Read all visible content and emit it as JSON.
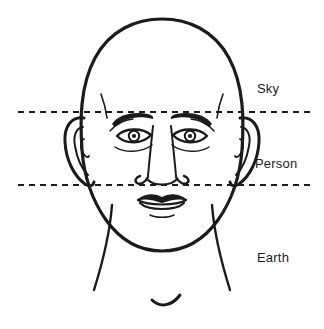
{
  "figure": {
    "background_color": "#ffffff",
    "ink_color": "#1b1b1b",
    "width": 324,
    "height": 329
  },
  "labels": {
    "sky": "Sky",
    "person": "Person",
    "earth": "Earth"
  },
  "divider_lines": [
    {
      "name": "brow-line",
      "y": 112,
      "x_start": 18,
      "x_end": 310,
      "style": "dashed",
      "separates": "Sky / Person"
    },
    {
      "name": "nose-base-line",
      "y": 185,
      "x_start": 18,
      "x_end": 310,
      "style": "dashed",
      "separates": "Person / Earth"
    }
  ],
  "icons": {
    "head_outline": "head-outline-icon",
    "left_eye": "left-eye-icon",
    "right_eye": "right-eye-icon",
    "left_eyebrow": "left-eyebrow-icon",
    "right_eyebrow": "right-eyebrow-icon",
    "nose": "nose-icon",
    "mouth": "mouth-icon",
    "left_ear": "left-ear-icon",
    "right_ear": "right-ear-icon",
    "neck": "neck-icon",
    "collarbone": "collarbone-icon"
  }
}
